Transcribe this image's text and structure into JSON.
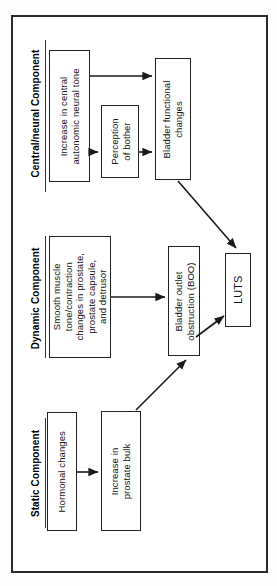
{
  "figure": {
    "type": "flowchart",
    "title": "",
    "background_color": "#ffffff",
    "border_color": "#2a2a2a",
    "text_orientation": "rotated-90-counterclockwise"
  },
  "sections": [
    {
      "id": "central",
      "label": "Central/neural Component"
    },
    {
      "id": "dynamic",
      "label": "Dynamic Component"
    },
    {
      "id": "static",
      "label": "Static Component"
    }
  ],
  "nodes": [
    {
      "id": "autonomic_tone",
      "label": "Increase in central\nautonomic neural tone",
      "section": "central"
    },
    {
      "id": "perception",
      "label": "Perception\nof bother",
      "section": "central"
    },
    {
      "id": "bladder_func",
      "label": "Bladder functional\nchanges",
      "section": "central"
    },
    {
      "id": "smooth_muscle",
      "label": "Smooth muscle\ntone/contraction\nchanges in prostate,\nprostate capsule,\nand detrusor",
      "section": "dynamic"
    },
    {
      "id": "boo",
      "label": "Bladder outlet\nobstruction (BOO)",
      "section": "dynamic"
    },
    {
      "id": "hormonal",
      "label": "Hormonal changes",
      "section": "static"
    },
    {
      "id": "prostate_bulk",
      "label": "Increase in\nprostate bulk",
      "section": "static"
    },
    {
      "id": "luts",
      "label": "LUTS",
      "section": "outcome"
    }
  ],
  "edges": [
    {
      "from": "autonomic_tone",
      "to": "bladder_func",
      "style": "arrow"
    },
    {
      "from": "autonomic_tone",
      "to": "perception",
      "style": "arrow"
    },
    {
      "from": "perception",
      "to": "bladder_func",
      "style": "arrow"
    },
    {
      "from": "bladder_func",
      "to": "luts",
      "style": "arrow-diagonal"
    },
    {
      "from": "smooth_muscle",
      "to": "boo",
      "style": "arrow"
    },
    {
      "from": "boo",
      "to": "luts",
      "style": "arrow-diagonal"
    },
    {
      "from": "prostate_bulk",
      "to": "boo",
      "style": "arrow-diagonal"
    }
  ]
}
